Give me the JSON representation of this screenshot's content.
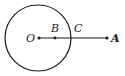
{
  "diagram": {
    "type": "geometry",
    "colors": {
      "stroke": "#1a1a1a",
      "background": "#ffffff"
    },
    "circle": {
      "center": "O",
      "cx": 38,
      "cy": 38,
      "r": 33
    },
    "segment": {
      "from": "O",
      "to": "A"
    },
    "points": [
      {
        "id": "O",
        "label": "O",
        "x": 39,
        "y": 38,
        "dot": true,
        "label_x": 26,
        "label_y": 42
      },
      {
        "id": "B",
        "label": "B",
        "x": 55,
        "y": 38,
        "dot": true,
        "label_x": 51,
        "label_y": 32
      },
      {
        "id": "C",
        "label": "C",
        "x": 71,
        "y": 38,
        "dot": false,
        "label_x": 74,
        "label_y": 32
      },
      {
        "id": "A",
        "label": "A",
        "x": 107,
        "y": 38,
        "dot": true,
        "label_x": 111,
        "label_y": 42
      }
    ]
  }
}
